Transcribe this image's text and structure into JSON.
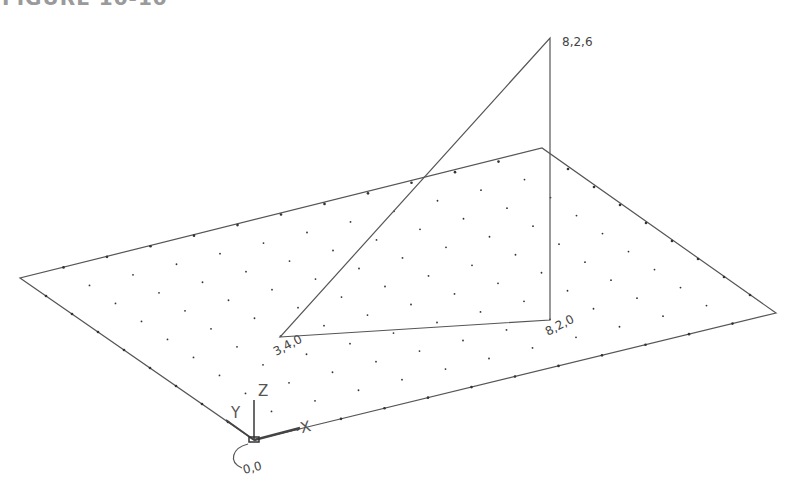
{
  "heading": "FIGURE 10-10",
  "colors": {
    "line": "#555555",
    "dot": "#333333",
    "text": "#444444"
  },
  "plane": {
    "origin": [
      254,
      440
    ],
    "x_corner": [
      776,
      313
    ],
    "y_corner": [
      20,
      278
    ],
    "far_corner": [
      542,
      148
    ],
    "grid_x_count": 12,
    "grid_y_count": 9
  },
  "triangle": {
    "points": [
      {
        "label": "3,4,0",
        "xy": [
          280,
          337
        ]
      },
      {
        "label": "8,2,0",
        "xy": [
          550,
          320
        ]
      },
      {
        "label": "8,2,6",
        "xy": [
          550,
          38
        ]
      }
    ]
  },
  "labels": {
    "p1": "3,4,0",
    "p2": "8,2,0",
    "p3": "8,2,6",
    "origin": "0,0",
    "axis_x": "X",
    "axis_y": "Y",
    "axis_z": "Z"
  }
}
